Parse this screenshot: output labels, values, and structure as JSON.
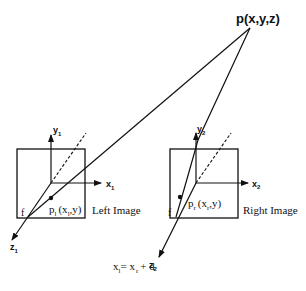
{
  "diagram": {
    "point": {
      "label": "p(x,y,z)"
    },
    "left_camera": {
      "y_axis": "y",
      "y_sub": "1",
      "x_axis": "x",
      "x_sub": "1",
      "z_axis": "z",
      "z_sub": "1",
      "focal_label": "f",
      "projection_base": "p",
      "projection_sub": "l",
      "projection_coords_a": "(x",
      "projection_coords_sub": "l",
      "projection_coords_b": ",y)",
      "image_label": "Left Image"
    },
    "right_camera": {
      "y_axis": "y",
      "y_sub": "2",
      "x_axis": "x",
      "x_sub": "2",
      "z_axis": "z",
      "z_sub": "2",
      "focal_label": "f",
      "projection_base": "p",
      "projection_sub": "r",
      "projection_coords_a": "(x",
      "projection_coords_sub": "r",
      "projection_coords_b": ",y)",
      "image_label": "Right Image"
    },
    "equation": {
      "lhs": "x",
      "lhs_sub": "l",
      "eq": "= x",
      "rhs_sub": "r",
      "tail": "+ d"
    },
    "colors": {
      "stroke": "#111111",
      "background": "#ffffff"
    }
  }
}
